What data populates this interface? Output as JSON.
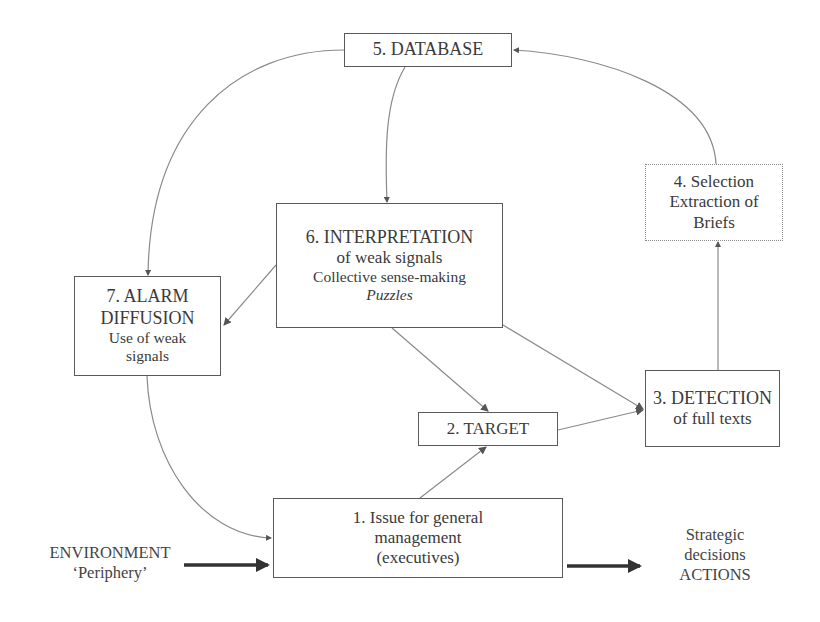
{
  "nodes": {
    "n1": {
      "lines": [
        "1. Issue for general",
        "management",
        "(executives)"
      ]
    },
    "n2": {
      "title": "2. TARGET"
    },
    "n3": {
      "title": "3. DETECTION",
      "subtitle": "of full texts"
    },
    "n4": {
      "lines": [
        "4. Selection",
        "Extraction of",
        "Briefs"
      ]
    },
    "n5": {
      "title": "5. DATABASE"
    },
    "n6": {
      "title": "6. INTERPRETATION",
      "subtitle": "of weak signals",
      "detail": "Collective sense-making",
      "emphasis": "Puzzles"
    },
    "n7": {
      "lines": [
        "7. ALARM",
        "DIFFUSION",
        "Use of weak",
        "signals"
      ]
    }
  },
  "inputs": {
    "environment": "ENVIRONMENT",
    "periphery": "‘Periphery’"
  },
  "outputs": {
    "lines": [
      "Strategic",
      "decisions",
      "ACTIONS"
    ]
  },
  "colors": {
    "line": "#8a8a8a",
    "box_border": "#5a5a5a",
    "thick_arrow": "#333333",
    "text": "#3a3a3a"
  }
}
